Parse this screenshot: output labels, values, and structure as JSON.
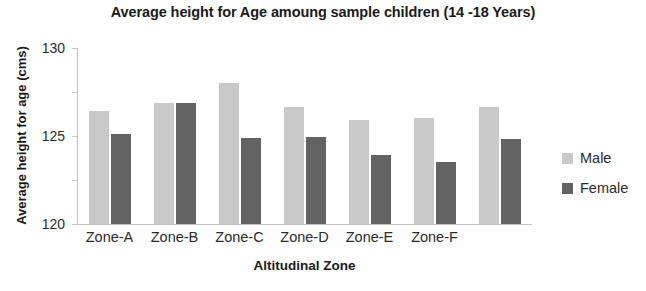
{
  "chart_data": {
    "type": "bar",
    "title": "Average height for Age amoung sample children (14 -18 Years)",
    "xlabel": "Altitudinal Zone",
    "ylabel": "Average height for age (cms)",
    "categories": [
      "Zone-A",
      "Zone-B",
      "Zone-C",
      "Zone-D",
      "Zone-E",
      "Zone-F",
      ""
    ],
    "series": [
      {
        "name": "Male",
        "color": "#c9c9c9",
        "values": [
          122.8,
          123.7,
          126.0,
          123.3,
          121.8,
          122.0,
          123.3
        ]
      },
      {
        "name": "Female",
        "color": "#636363",
        "values": [
          120.2,
          123.7,
          119.8,
          119.9,
          117.8,
          117.1,
          119.7
        ]
      }
    ],
    "ylim": [
      110,
      130
    ],
    "yticks": [
      110,
      115,
      120,
      125,
      130
    ],
    "ytick_labels": [
      "110",
      "115",
      "120",
      "125",
      "130"
    ],
    "grid": false,
    "legend_position": "right"
  }
}
